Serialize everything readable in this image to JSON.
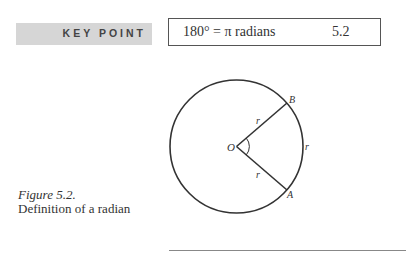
{
  "key_point": {
    "label": "KEY POINT",
    "equation": "180° = π radians",
    "equation_number": "5.2"
  },
  "figure": {
    "caption_number": "Figure 5.2.",
    "caption_text": "Definition of a radian",
    "labels": {
      "center": "O",
      "point_b": "B",
      "point_a": "A",
      "radius_upper": "r",
      "radius_lower": "r",
      "arc": "r"
    }
  }
}
